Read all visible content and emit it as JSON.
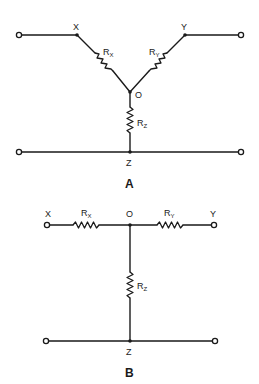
{
  "diagrams": [
    {
      "id": "A",
      "caption": "A",
      "type": "wye (Y) resistor network",
      "nodes": {
        "X": "X",
        "Y": "Y",
        "O": "O",
        "Z": "Z"
      },
      "resistors": [
        {
          "name": "R",
          "sub": "X",
          "between": [
            "X",
            "O"
          ]
        },
        {
          "name": "R",
          "sub": "Y",
          "between": [
            "Y",
            "O"
          ]
        },
        {
          "name": "R",
          "sub": "Z",
          "between": [
            "O",
            "Z"
          ]
        }
      ]
    },
    {
      "id": "B",
      "caption": "B",
      "type": "tee (T) resistor network",
      "nodes": {
        "X": "X",
        "Y": "Y",
        "O": "O",
        "Z": "Z"
      },
      "resistors": [
        {
          "name": "R",
          "sub": "X",
          "between": [
            "X",
            "O"
          ]
        },
        {
          "name": "R",
          "sub": "Y",
          "between": [
            "O",
            "Y"
          ]
        },
        {
          "name": "R",
          "sub": "Z",
          "between": [
            "O",
            "Z"
          ]
        }
      ]
    }
  ]
}
